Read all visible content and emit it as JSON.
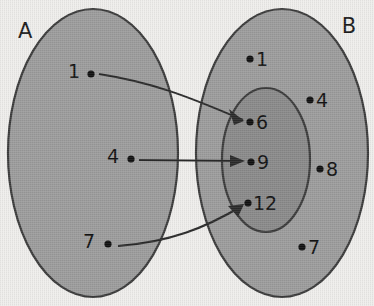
{
  "diagram": {
    "type": "venn-mapping",
    "canvas": {
      "width": 374,
      "height": 306
    },
    "background_color": "#efeeec",
    "set_a": {
      "label": "A",
      "label_x": 18,
      "label_y": 38,
      "fill_color": "#9c9c9c",
      "stroke_color": "#3b3b3b",
      "cx": 93,
      "cy": 153,
      "rx": 85,
      "ry": 144,
      "elements": [
        {
          "value": "1",
          "dot_x": 91,
          "dot_y": 74,
          "label_x": 74,
          "label_y": 78
        },
        {
          "value": "4",
          "dot_x": 131,
          "dot_y": 159,
          "label_x": 113,
          "label_y": 163
        },
        {
          "value": "7",
          "dot_x": 108,
          "dot_y": 244,
          "label_x": 89,
          "label_y": 248
        }
      ]
    },
    "set_b": {
      "label": "B",
      "label_x": 349,
      "label_y": 33,
      "fill_color": "#9c9c9c",
      "stroke_color": "#3b3b3b",
      "cx": 282,
      "cy": 153,
      "rx": 86,
      "ry": 144,
      "elements": [
        {
          "value": "1",
          "dot_x": 250,
          "dot_y": 59,
          "label_x": 256,
          "label_y": 65
        },
        {
          "value": "4",
          "dot_x": 310,
          "dot_y": 100,
          "label_x": 316,
          "label_y": 106
        },
        {
          "value": "8",
          "dot_x": 320,
          "dot_y": 169,
          "label_x": 326,
          "label_y": 175
        },
        {
          "value": "7",
          "dot_x": 302,
          "dot_y": 247,
          "label_x": 308,
          "label_y": 253
        }
      ]
    },
    "subset_inner": {
      "fill_color": "#8a8a8a",
      "stroke_color": "#3b3b3b",
      "cx": 266,
      "cy": 160,
      "rx": 44,
      "ry": 72,
      "elements": [
        {
          "value": "6",
          "dot_x": 250,
          "dot_y": 122,
          "label_x": 256,
          "label_y": 129
        },
        {
          "value": "9",
          "dot_x": 251,
          "dot_y": 162,
          "label_x": 257,
          "label_y": 169
        },
        {
          "value": "12",
          "dot_x": 248,
          "dot_y": 203,
          "label_x": 253,
          "label_y": 210
        }
      ]
    },
    "mappings": [
      {
        "name": "mapping-1-to-6",
        "from_value": "1",
        "to_value": "6",
        "path": "M 99 74 C 150 82, 185 95, 243 120",
        "head_points": "243,120 231,111 235,124"
      },
      {
        "name": "mapping-4-to-9",
        "from_value": "4",
        "to_value": "9",
        "path": "M 139 160 L 243 161",
        "head_points": "245,161 231,155 231,167"
      },
      {
        "name": "mapping-7-to-12",
        "from_value": "7",
        "to_value": "12",
        "path": "M 118 246 C 170 242, 205 228, 242 206",
        "head_points": "243,205 230,208 239,216"
      }
    ]
  }
}
